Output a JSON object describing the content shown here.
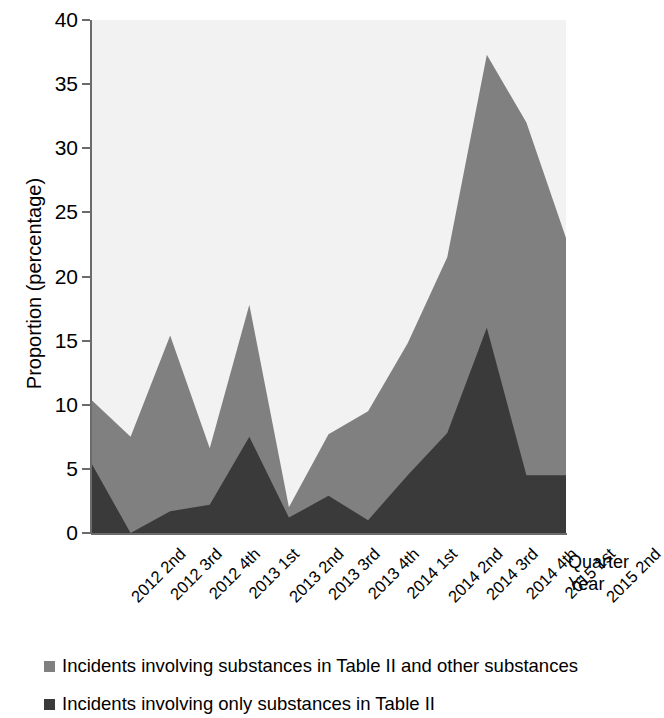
{
  "chart_data": {
    "type": "area",
    "title": "",
    "subtitle": "",
    "xlabel": "Quarter Year",
    "ylabel": "Proportion (percentage)",
    "stacked": true,
    "grid": false,
    "legend_position": "bottom",
    "ylim": [
      0,
      40
    ],
    "yticks": [
      0,
      5,
      10,
      15,
      20,
      25,
      30,
      35,
      40
    ],
    "ytick_labels": [
      "0",
      "5",
      "10",
      "15",
      "20",
      "25",
      "30",
      "35",
      "40"
    ],
    "categories": [
      "2012 2nd",
      "2012 3rd",
      "2012 4th",
      "2013 1st",
      "2013 2nd",
      "2013 3rd",
      "2013 4th",
      "2014 1st",
      "2014 2nd",
      "2014 3rd",
      "2014 4th",
      "2015 1st",
      "2015 2nd"
    ],
    "series": [
      {
        "name": "Incidents involving only substances in Table II",
        "color": "#3a3a3a",
        "values": [
          5.5,
          0.0,
          1.7,
          2.2,
          7.5,
          1.2,
          2.9,
          1.0,
          4.5,
          7.8,
          16.0,
          4.5,
          4.5
        ]
      },
      {
        "name": "Incidents involving substances in Table II and other substances",
        "color": "#808080",
        "values": [
          4.9,
          7.5,
          13.7,
          4.4,
          10.3,
          0.8,
          4.8,
          8.5,
          10.3,
          13.7,
          21.3,
          27.5,
          18.5
        ]
      }
    ],
    "cumulative_totals": [
      10.4,
      7.5,
      15.4,
      6.6,
      17.8,
      2.0,
      7.7,
      9.5,
      14.8,
      21.5,
      37.3,
      32.0,
      23.0
    ],
    "plot_background_color": "#f2f2f2",
    "axis_color": "#6b6b6b"
  },
  "legend": {
    "entries": [
      {
        "label": "Incidents involving substances in Table II and other substances",
        "color": "#808080"
      },
      {
        "label": "Incidents involving only substances in Table II",
        "color": "#3a3a3a"
      }
    ]
  },
  "x_axis_title": {
    "line1": "Quarter",
    "line2": "Year"
  }
}
